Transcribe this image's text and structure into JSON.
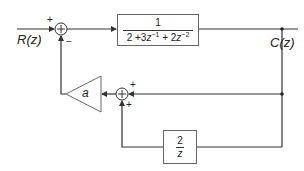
{
  "diagram": {
    "input": {
      "label": "R(z)"
    },
    "output": {
      "label": "C(z)"
    },
    "forward_block": {
      "numerator": "1",
      "denominator_parts": [
        "2 +3",
        "z",
        "−1",
        " + 2",
        "z",
        "−2"
      ],
      "expression": "1 / (2 + 3z^-1 + 2z^-2)"
    },
    "gain_block": {
      "label": "a"
    },
    "feedback_block": {
      "numerator": "2",
      "denominator": "z"
    },
    "summing_junction_1": {
      "input_sign_left": "+",
      "input_sign_bottom": "−"
    },
    "summing_junction_2": {
      "input_sign_right": "+",
      "input_sign_bottom": "+"
    },
    "colors": {
      "line": "#333333",
      "box_border": "#666666",
      "text": "#222222"
    }
  }
}
